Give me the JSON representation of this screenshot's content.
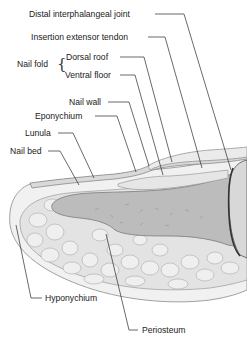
{
  "figure": {
    "colors": {
      "bone": "#b9b9b9",
      "fat": "#e2e2e2",
      "fat_outline": "#a8a8a8",
      "skin": "#ececec",
      "nail_plate": "#d6d6d6",
      "leader": "#2a2a2a",
      "joint_shadow": "#3a3a3a"
    }
  },
  "labels": {
    "distal_interphalangeal_joint": "Distal interphalangeal joint",
    "insertion_extensor_tendon": "Insertion extensor tendon",
    "nail_fold": "Nail fold",
    "dorsal_roof": "Dorsal roof",
    "ventral_floor": "Ventral floor",
    "nail_wall": "Nail wall",
    "eponychium": "Eponychium",
    "lunula": "Lunula",
    "nail_bed": "Nail bed",
    "hyponychium": "Hyponychium",
    "periosteum": "Periosteum"
  },
  "brace_glyph": "{"
}
